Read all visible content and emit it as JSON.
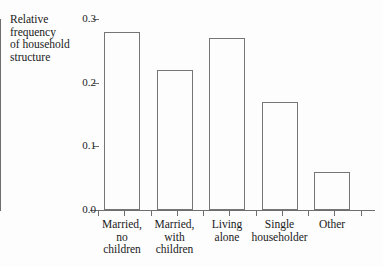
{
  "chart_data": {
    "type": "bar",
    "title": "",
    "subtitle": "",
    "xlabel": "",
    "ylabel": "Relative\nfrequency\nof household\nstructure",
    "categories": [
      "Married,\nno\nchildren",
      "Married,\nwith\nchildren",
      "Living\nalone",
      "Single\nhouseholder",
      "Other"
    ],
    "values": [
      0.28,
      0.22,
      0.27,
      0.17,
      0.06
    ],
    "ylim": [
      0.0,
      0.3
    ],
    "ytick_labels": [
      "0.0",
      "0.1",
      "0.2",
      "0.3"
    ],
    "ytick_values": [
      0.0,
      0.1,
      0.2,
      0.3
    ],
    "grid": false,
    "legend": false,
    "legend_position": "none",
    "bar_fill": "none",
    "bar_edge_color": "#757575",
    "axis_color": "#6e6e6e",
    "background_color": "#fdfdfd"
  }
}
